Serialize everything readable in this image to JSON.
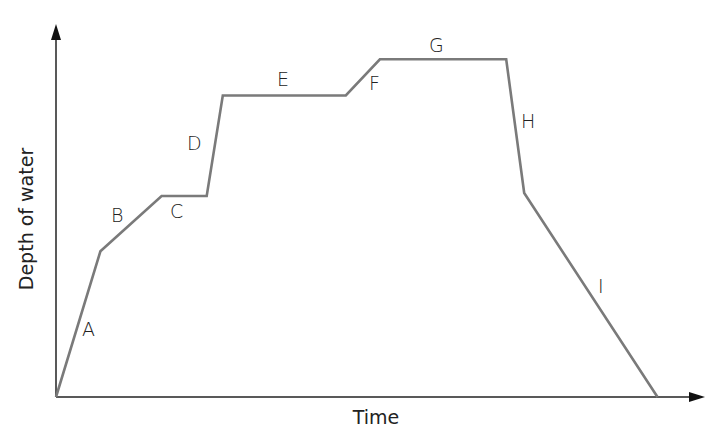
{
  "chart_data": {
    "type": "line",
    "title": "",
    "xlabel": "Time",
    "ylabel": "Depth of water",
    "grid": false,
    "legend": null,
    "ticks": {
      "x": [],
      "y": []
    },
    "units": "relative (no numeric scale shown); x: 0-100 of time axis, y: 0-100 of depth axis",
    "points": [
      {
        "x": 0.0,
        "y": 0.0
      },
      {
        "x": 6.9,
        "y": 43.5
      },
      {
        "x": 16.4,
        "y": 60.0
      },
      {
        "x": 23.4,
        "y": 60.0
      },
      {
        "x": 25.9,
        "y": 90.0
      },
      {
        "x": 45.0,
        "y": 90.0
      },
      {
        "x": 50.3,
        "y": 100.8
      },
      {
        "x": 69.9,
        "y": 100.8
      },
      {
        "x": 72.7,
        "y": 60.9
      },
      {
        "x": 93.4,
        "y": 0.0
      }
    ],
    "segments": [
      {
        "label": "A",
        "from": 0,
        "to": 1,
        "trend": "rising steeply"
      },
      {
        "label": "B",
        "from": 1,
        "to": 2,
        "trend": "rising slowly"
      },
      {
        "label": "C",
        "from": 2,
        "to": 3,
        "trend": "constant"
      },
      {
        "label": "D",
        "from": 3,
        "to": 4,
        "trend": "rising very steeply"
      },
      {
        "label": "E",
        "from": 4,
        "to": 5,
        "trend": "constant"
      },
      {
        "label": "F",
        "from": 5,
        "to": 6,
        "trend": "rising"
      },
      {
        "label": "G",
        "from": 6,
        "to": 7,
        "trend": "constant"
      },
      {
        "label": "H",
        "from": 7,
        "to": 8,
        "trend": "falling steeply"
      },
      {
        "label": "I",
        "from": 8,
        "to": 9,
        "trend": "falling"
      }
    ],
    "colors": {
      "line": "#7a7a7a",
      "axes": "#222222",
      "text": "#222222"
    }
  },
  "labels": {
    "x_axis": "Time",
    "y_axis": "Depth of water",
    "segments": [
      "A",
      "B",
      "C",
      "D",
      "E",
      "F",
      "G",
      "H",
      "I"
    ]
  }
}
